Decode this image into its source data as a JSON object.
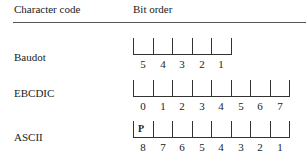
{
  "header": {
    "col1": "Character code",
    "col2": "Bit order"
  },
  "rows": [
    {
      "label": "Baudot",
      "bits": [
        "5",
        "4",
        "3",
        "2",
        "1"
      ],
      "cell_labels": {}
    },
    {
      "label": "EBCDIC",
      "bits": [
        "0",
        "1",
        "2",
        "3",
        "4",
        "5",
        "6",
        "7"
      ],
      "cell_labels": {}
    },
    {
      "label": "ASCII",
      "bits": [
        "8",
        "7",
        "6",
        "5",
        "4",
        "3",
        "2",
        "1"
      ],
      "cell_labels": {
        "0": "P"
      }
    }
  ]
}
